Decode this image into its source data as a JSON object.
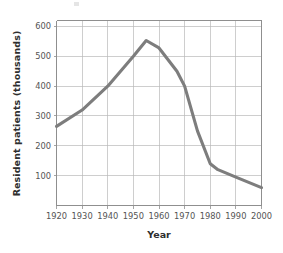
{
  "chart_data": {
    "type": "line",
    "title": "",
    "xlabel": "Year",
    "ylabel": "Resident patients (thousands)",
    "xlim": [
      1920,
      2000
    ],
    "ylim": [
      0,
      620
    ],
    "xticks": [
      1920,
      1930,
      1940,
      1950,
      1960,
      1970,
      1980,
      1990,
      2000
    ],
    "xticklabels": [
      "1920",
      "1930",
      "1940",
      "1950",
      "1960",
      "1970",
      "1980",
      "1990",
      "2000"
    ],
    "yticks": [
      100,
      200,
      300,
      400,
      500,
      600
    ],
    "yticklabels": [
      "100",
      "200",
      "300",
      "400",
      "500",
      "600"
    ],
    "grid": true,
    "legend": false,
    "line_color": "#7d7d7d",
    "grid_color": "#b9b9b9",
    "axis_color": "#8f8f8f",
    "series": [
      {
        "name": "Resident patients",
        "x": [
          1920,
          1930,
          1940,
          1950,
          1955,
          1960,
          1967,
          1970,
          1975,
          1980,
          1983,
          1990,
          2000
        ],
        "values": [
          265,
          320,
          400,
          500,
          553,
          528,
          450,
          400,
          250,
          140,
          120,
          95,
          60
        ]
      }
    ]
  },
  "axis_titles": {
    "x": "Year",
    "y": "Resident patients (thousands)"
  }
}
